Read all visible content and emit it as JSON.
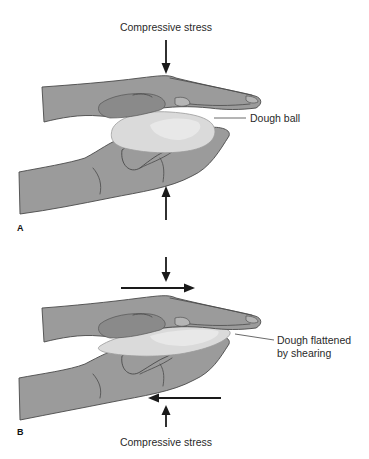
{
  "figure": {
    "panels": [
      {
        "id": "A",
        "label": "A",
        "top_label": "Compressive stress",
        "callout": "Dough ball",
        "arrows": [
          "down",
          "up"
        ]
      },
      {
        "id": "B",
        "label": "B",
        "bottom_label": "Compressive stress",
        "callout_line1": "Dough flattened",
        "callout_line2": "by shearing",
        "arrows": [
          "down",
          "right",
          "left",
          "up"
        ]
      }
    ],
    "colors": {
      "hand": "#9b9b9b",
      "dough": "#dadada",
      "arrow": "#1a1a1a",
      "text": "#2a2a2a"
    }
  }
}
